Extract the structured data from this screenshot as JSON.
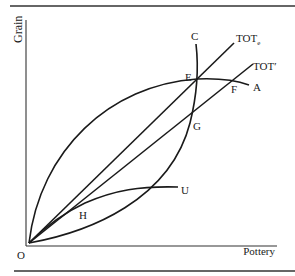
{
  "figure": {
    "axes": {
      "x_label": "Pottery",
      "y_label": "Grain",
      "origin_label": "O"
    },
    "curves": {
      "A": "A",
      "C": "C",
      "U": "U"
    },
    "lines": {
      "tot_e_main": "TOT",
      "tot_e_sub": "e",
      "tot_prime": "TOT′"
    },
    "points": {
      "E": "E",
      "F": "F",
      "G": "G",
      "H": "H"
    },
    "colors": {
      "ink": "#1a1a1a",
      "background": "#ffffff"
    }
  }
}
